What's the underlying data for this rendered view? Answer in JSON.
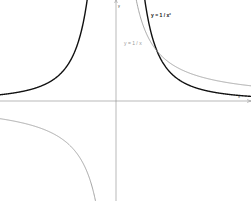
{
  "chart_data": {
    "type": "line",
    "title": "",
    "xlabel": "x",
    "ylabel": "y",
    "xlim": [
      -2.83,
      3.3
    ],
    "ylim": [
      -2.0,
      2.02
    ],
    "grid": false,
    "legend": "inline labels",
    "series": [
      {
        "name": "y = 1 / x²",
        "color": "#111111",
        "stroke_width": 1.4,
        "x": [
          -2.8,
          -2.0,
          -1.5,
          -1.0,
          -0.8,
          -0.7,
          0.7,
          0.8,
          1.0,
          1.5,
          2.0,
          2.5,
          3.2
        ],
        "y": [
          0.128,
          0.25,
          0.444,
          1.0,
          1.5625,
          2.04,
          2.04,
          1.5625,
          1.0,
          0.444,
          0.25,
          0.16,
          0.098
        ]
      },
      {
        "name": "y = 1 / x",
        "color": "#9a9a9a",
        "stroke_width": 0.9,
        "x": [
          -2.8,
          -2.0,
          -1.5,
          -1.0,
          -0.7,
          -0.5,
          0.5,
          0.7,
          1.0,
          1.5,
          2.0,
          2.5,
          3.2
        ],
        "y": [
          -0.357,
          -0.5,
          -0.667,
          -1.0,
          -1.43,
          -2.0,
          2.0,
          1.43,
          1.0,
          0.667,
          0.5,
          0.4,
          0.3125
        ]
      }
    ],
    "annotations": [
      {
        "text": "y = 1 / x²",
        "x": 0.86,
        "y": 1.75
      },
      {
        "text": "y = 1 / x",
        "x": 0.2,
        "y": 1.18
      }
    ]
  },
  "labels": {
    "inv_square": "y = 1 / x²",
    "inverse": "y = 1 / x",
    "y_axis": "y",
    "x_axis": "x"
  },
  "layout": {
    "origin_px": [
      116,
      101
    ],
    "unit_x_px": 41,
    "unit_y_px": 50
  }
}
